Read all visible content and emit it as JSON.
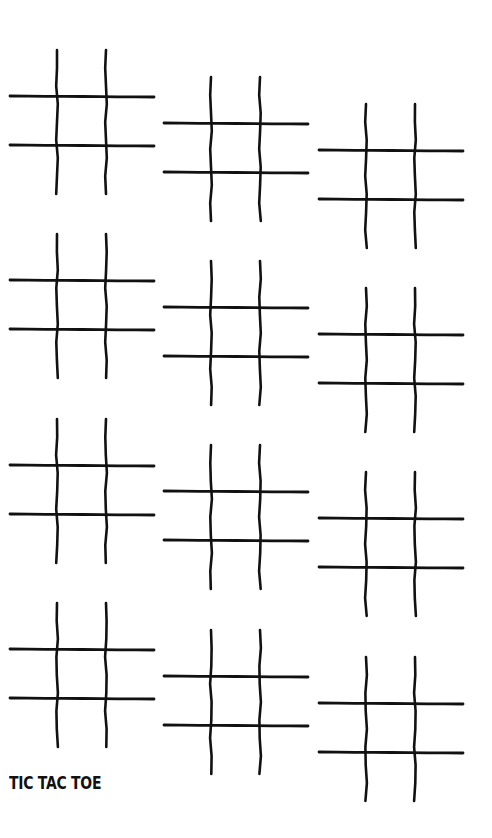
{
  "title": "TIC TAC TOE",
  "colors": {
    "background": "#ffffff",
    "ink": "#111111"
  },
  "boards": [
    {
      "id": 1,
      "col": 1,
      "row": 1,
      "x": 10,
      "y": 48
    },
    {
      "id": 2,
      "col": 2,
      "row": 1,
      "x": 164,
      "y": 75
    },
    {
      "id": 3,
      "col": 3,
      "row": 1,
      "x": 319,
      "y": 102
    },
    {
      "id": 4,
      "col": 1,
      "row": 2,
      "x": 10,
      "y": 232
    },
    {
      "id": 5,
      "col": 2,
      "row": 2,
      "x": 164,
      "y": 259
    },
    {
      "id": 6,
      "col": 3,
      "row": 2,
      "x": 319,
      "y": 286
    },
    {
      "id": 7,
      "col": 1,
      "row": 3,
      "x": 10,
      "y": 417
    },
    {
      "id": 8,
      "col": 2,
      "row": 3,
      "x": 164,
      "y": 443
    },
    {
      "id": 9,
      "col": 3,
      "row": 3,
      "x": 319,
      "y": 470
    },
    {
      "id": 10,
      "col": 1,
      "row": 4,
      "x": 10,
      "y": 601
    },
    {
      "id": 11,
      "col": 2,
      "row": 4,
      "x": 164,
      "y": 628
    },
    {
      "id": 12,
      "col": 3,
      "row": 4,
      "x": 319,
      "y": 655
    }
  ],
  "cells_per_board": 9,
  "cell_marks": [
    "",
    "",
    "",
    "",
    "",
    "",
    "",
    "",
    ""
  ]
}
